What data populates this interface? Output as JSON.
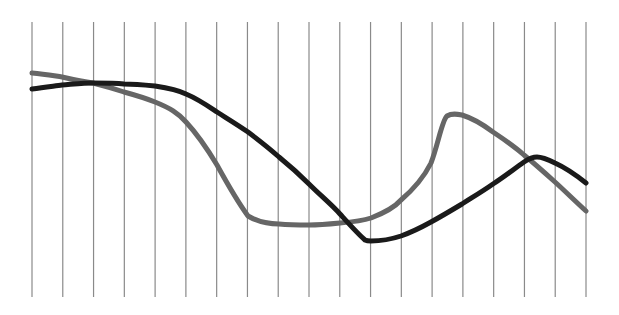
{
  "chart_data": {
    "type": "line",
    "title": "",
    "xlabel": "",
    "ylabel": "",
    "grid": {
      "vertical": true,
      "horizontal": false,
      "count": 19
    },
    "legend": null,
    "x": [
      0,
      1,
      2,
      3,
      4,
      5,
      6,
      7,
      8,
      9,
      10,
      11,
      12,
      13,
      14,
      15,
      16,
      17,
      18
    ],
    "ylim": [
      0,
      100
    ],
    "series": [
      {
        "name": "gray-series",
        "color": "#666666",
        "values": [
          81,
          79,
          77,
          73,
          69,
          60,
          41,
          19,
          15,
          15,
          16,
          18,
          26,
          42,
          64,
          57,
          47,
          35,
          22
        ]
      },
      {
        "name": "black-series",
        "color": "#1a1a1a",
        "values": [
          74,
          76,
          77,
          77,
          76,
          72,
          64,
          55,
          44,
          32,
          19,
          2,
          4,
          10,
          18,
          27,
          36,
          35,
          27
        ]
      }
    ]
  },
  "layout": {
    "plot_left": 32,
    "plot_right": 586,
    "plot_top": 22,
    "plot_bottom": 297
  }
}
